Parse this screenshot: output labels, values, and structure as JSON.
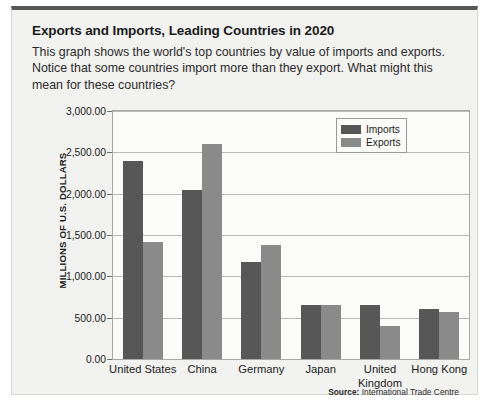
{
  "card": {
    "title": "Exports and Imports, Leading Countries in 2020",
    "description": "This graph shows the world's top countries by value of imports and exports. Notice that some countries import more than they export. What might this mean for these countries?",
    "source_prefix": "Source:",
    "source_text": "International Trade Centre"
  },
  "colors": {
    "imports": "#575757",
    "exports": "#8a8a8a",
    "card_background": "#f2f2f0",
    "plot_background": "#fbfbfa",
    "gridline": "#b9b9b5",
    "frame": "#a8a8a4"
  },
  "chart_data": {
    "type": "bar",
    "title": "Exports and Imports, Leading Countries in 2020",
    "xlabel": "",
    "ylabel": "MILLIONS OF U.S. DOLLARS",
    "ylim": [
      0,
      3000
    ],
    "yticks": [
      0,
      500,
      1000,
      1500,
      2000,
      2500,
      3000
    ],
    "ytick_labels": [
      "0.00",
      "500.00",
      "1,000.00",
      "1,500.00",
      "2,000.00",
      "2,500.00",
      "3,000.00"
    ],
    "grid": true,
    "legend_position": "top-right",
    "categories": [
      "United States",
      "China",
      "Germany",
      "Japan",
      "United Kingdom",
      "Hong Kong"
    ],
    "series": [
      {
        "name": "Imports",
        "values": [
          2400,
          2050,
          1170,
          650,
          650,
          600
        ]
      },
      {
        "name": "Exports",
        "values": [
          1420,
          2600,
          1380,
          650,
          400,
          570
        ]
      }
    ]
  }
}
